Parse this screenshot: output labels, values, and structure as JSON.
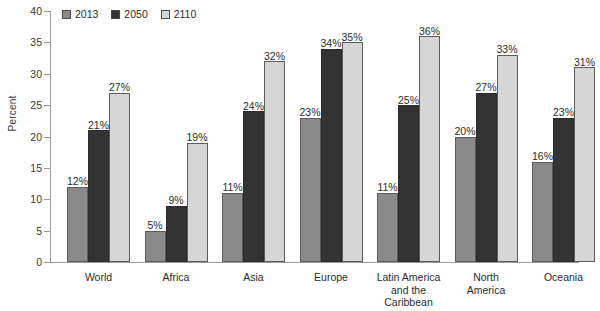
{
  "chart_data": {
    "type": "bar",
    "title": "",
    "xlabel": "",
    "ylabel": "Percent",
    "ylim": [
      0,
      40
    ],
    "ytick_step": 5,
    "yticks": [
      0,
      5,
      10,
      15,
      20,
      25,
      30,
      35,
      40
    ],
    "grid": false,
    "legend_position": "top-left",
    "value_label_suffix": "%",
    "categories": [
      "World",
      "Africa",
      "Asia",
      "Europe",
      "Latin America and the Caribbean",
      "North America",
      "Oceania"
    ],
    "category_label_lines": [
      [
        "World"
      ],
      [
        "Africa"
      ],
      [
        "Asia"
      ],
      [
        "Europe"
      ],
      [
        "Latin America",
        "and the",
        "Caribbean"
      ],
      [
        "North",
        "America"
      ],
      [
        "Oceania"
      ]
    ],
    "series": [
      {
        "name": "2013",
        "color": "#8a8a8a",
        "values": [
          12,
          5,
          11,
          23,
          11,
          20,
          16
        ],
        "labels": [
          "12%",
          "5%",
          "11%",
          "23%",
          "11%",
          "20%",
          "16%"
        ]
      },
      {
        "name": "2050",
        "color": "#333333",
        "values": [
          21,
          9,
          24,
          34,
          25,
          27,
          23
        ],
        "labels": [
          "21%",
          "9%",
          "24%",
          "34%",
          "25%",
          "27%",
          "23%"
        ]
      },
      {
        "name": "2110",
        "color": "#d6d6d6",
        "values": [
          27,
          19,
          32,
          35,
          36,
          33,
          31
        ],
        "labels": [
          "27%",
          "19%",
          "32%",
          "35%",
          "36%",
          "33%",
          "31%"
        ]
      }
    ]
  },
  "axis": {
    "y_title": "Percent",
    "y_labels": [
      "40",
      "35",
      "30",
      "25",
      "20",
      "15",
      "10",
      "5",
      "0"
    ]
  },
  "legend": {
    "items": [
      {
        "label": "2013",
        "color": "#8a8a8a"
      },
      {
        "label": "2050",
        "color": "#333333"
      },
      {
        "label": "2110",
        "color": "#d6d6d6"
      }
    ]
  }
}
